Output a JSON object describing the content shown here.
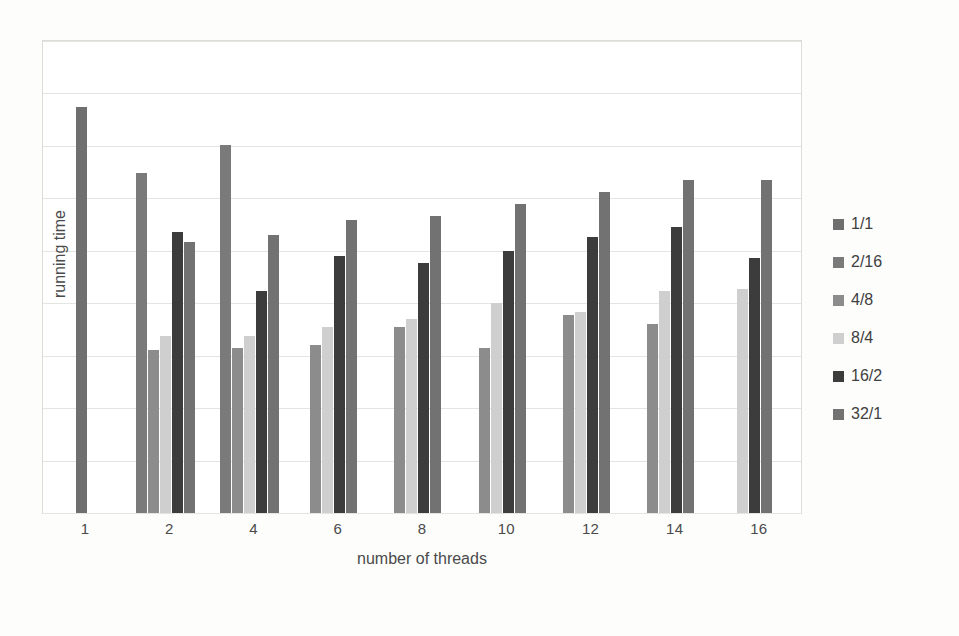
{
  "chart_data": {
    "type": "bar",
    "title": "",
    "xlabel": "number of threads",
    "ylabel": "running time",
    "categories": [
      "1",
      "2",
      "4",
      "6",
      "8",
      "10",
      "12",
      "14",
      "16"
    ],
    "grid": true,
    "gridlines": 9,
    "y_axis_ticks_shown": false,
    "ylim": [
      0,
      100
    ],
    "legend_position": "right",
    "series": [
      {
        "name": "1/1",
        "color": "#6f6f6f",
        "values": [
          86.0,
          null,
          null,
          null,
          null,
          null,
          null,
          null,
          null
        ]
      },
      {
        "name": "2/16",
        "color": "#7a7a7a",
        "values": [
          null,
          72.0,
          78.0,
          null,
          null,
          null,
          null,
          null,
          null
        ]
      },
      {
        "name": "4/8",
        "color": "#8c8c8c",
        "values": [
          null,
          34.5,
          35.0,
          35.5,
          39.5,
          35.0,
          42.0,
          40.0,
          null
        ]
      },
      {
        "name": "8/4",
        "color": "#cfcfcf",
        "values": [
          null,
          37.5,
          37.5,
          39.5,
          41.0,
          44.5,
          42.5,
          47.0,
          47.5
        ]
      },
      {
        "name": "16/2",
        "color": "#3c3c3c",
        "values": [
          null,
          59.5,
          47.0,
          54.5,
          53.0,
          55.5,
          58.5,
          60.5,
          54.0
        ]
      },
      {
        "name": "32/1",
        "color": "#727272",
        "values": [
          null,
          57.5,
          59.0,
          62.0,
          63.0,
          65.5,
          68.0,
          70.5,
          70.5
        ]
      }
    ]
  },
  "axes": {
    "x_title": "number of threads",
    "y_title": "running time"
  },
  "legend": {
    "items": [
      {
        "label": "1/1",
        "color": "#6f6f6f"
      },
      {
        "label": "2/16",
        "color": "#7a7a7a"
      },
      {
        "label": "4/8",
        "color": "#8c8c8c"
      },
      {
        "label": "8/4",
        "color": "#cfcfcf"
      },
      {
        "label": "16/2",
        "color": "#3c3c3c"
      },
      {
        "label": "32/1",
        "color": "#727272"
      }
    ]
  },
  "style": {
    "background": "#fdfdfc",
    "plot_background": "#ffffff",
    "grid_color": "#e4e4e0",
    "frame_color": "#dcdcd8",
    "text_color": "#4a4a4a"
  }
}
